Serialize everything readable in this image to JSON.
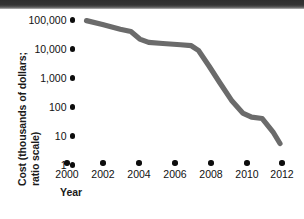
{
  "chart_data": {
    "type": "line",
    "title": "",
    "xlabel": "Year",
    "ylabel": "Cost (thousands of dollars; ratio scale)",
    "ylabel_line1": "Cost (thousands of dollars;",
    "ylabel_line2": "ratio scale)",
    "scale": "log",
    "grid": false,
    "legend": "none",
    "xlim": [
      2000,
      2012
    ],
    "ylim": [
      1,
      100000
    ],
    "x_ticks": [
      "2000",
      "2002",
      "2004",
      "2006",
      "2008",
      "2010",
      "2012"
    ],
    "y_ticks": [
      "100,000",
      "10,000",
      "1,000",
      "100",
      "10",
      "1"
    ],
    "y_tick_values": [
      100000,
      10000,
      1000,
      100,
      10,
      1
    ],
    "series": [
      {
        "name": "Cost",
        "x": [
          2001.1,
          2002.0,
          2003.0,
          2003.6,
          2004.1,
          2004.6,
          2005.4,
          2006.4,
          2007.0,
          2007.4,
          2008.0,
          2008.6,
          2009.3,
          2009.9,
          2010.4,
          2011.0,
          2011.6,
          2012.0
        ],
        "values": [
          95000,
          70000,
          48000,
          40000,
          22000,
          17000,
          15500,
          14000,
          13000,
          9000,
          2600,
          700,
          160,
          62,
          45,
          40,
          14,
          5.5
        ]
      }
    ],
    "line_color": "#6b6b6b",
    "line_width_px": 5.2,
    "tick_color": "#0d0d0d",
    "text_color": "#111111"
  },
  "artifacts": {
    "scan_band_color": "#2e2e2e"
  }
}
